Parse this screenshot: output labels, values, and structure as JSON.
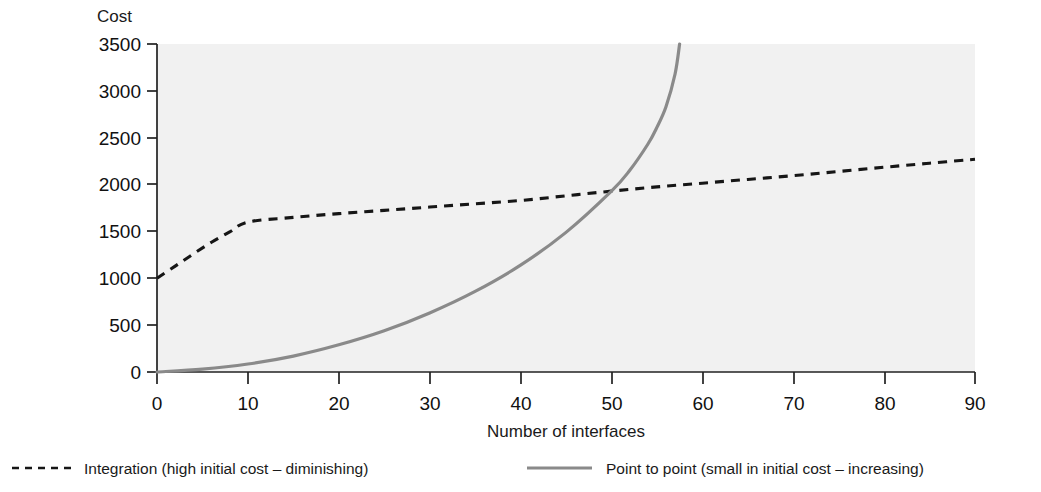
{
  "chart_data": {
    "type": "line",
    "title": "",
    "xlabel": "Number of interfaces",
    "ylabel": "Cost",
    "xlim": [
      0,
      90
    ],
    "ylim": [
      0,
      3500
    ],
    "xticks": [
      "0",
      "10",
      "20",
      "30",
      "40",
      "50",
      "60",
      "70",
      "80",
      "90"
    ],
    "yticks": [
      "0",
      "500",
      "1000",
      "1500",
      "2000",
      "2500",
      "3000",
      "3500"
    ],
    "grid": false,
    "legend_position": "below",
    "series": [
      {
        "name": "Integration (high initial cost – diminishing)",
        "style": "dashed",
        "color": "#161616",
        "x": [
          0,
          2,
          4,
          6,
          8,
          10,
          15,
          20,
          25,
          30,
          35,
          40,
          45,
          50,
          55,
          60,
          65,
          70,
          75,
          80,
          85,
          90
        ],
        "y": [
          1000,
          1130,
          1260,
          1385,
          1495,
          1600,
          1650,
          1690,
          1725,
          1760,
          1795,
          1830,
          1880,
          1930,
          1975,
          2015,
          2055,
          2095,
          2140,
          2185,
          2228,
          2270
        ]
      },
      {
        "name": "Point to point (small in initial cost – increasing)",
        "style": "solid",
        "color": "#8a8a8a",
        "x": [
          0,
          5,
          10,
          15,
          20,
          25,
          30,
          35,
          40,
          45,
          50,
          52,
          54,
          55,
          56,
          57,
          57.5
        ],
        "y": [
          0,
          30,
          85,
          170,
          290,
          440,
          630,
          860,
          1140,
          1490,
          1930,
          2150,
          2430,
          2610,
          2830,
          3180,
          3500
        ]
      }
    ],
    "annotations": []
  },
  "legend": {
    "entries": [
      {
        "marker": "dashed-line-swatch",
        "label": "Integration (high initial cost – diminishing)"
      },
      {
        "marker": "solid-line-swatch",
        "label": "Point to point (small in initial cost – increasing)"
      }
    ]
  }
}
